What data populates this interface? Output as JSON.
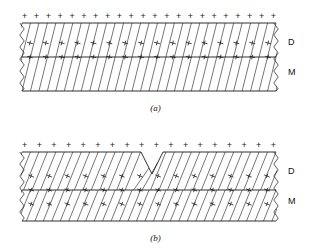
{
  "figure": {
    "type": "crystallography-schematic",
    "background_color": "#ffffff",
    "line_color": "#1a1a1a",
    "panels": [
      {
        "id": "a",
        "caption": "(a)",
        "plus_symbol": "+",
        "plus_count": 22,
        "labels": {
          "upper": "D",
          "lower": "M"
        },
        "geometry": {
          "left": 22,
          "right": 276,
          "top": 23,
          "bottom": 91,
          "interface_y": 57,
          "sub_band_y": 43,
          "upper_hatch_angle_deg": 14,
          "lower_hatch_angle_deg": 14,
          "hatch_count_upper": 30,
          "hatch_count_lower": 30,
          "dislocation_rows": [
            43,
            57
          ],
          "dislocations_per_row": 16,
          "notch": false
        }
      },
      {
        "id": "b",
        "caption": "(b)",
        "plus_symbol": "+",
        "plus_count": 18,
        "labels": {
          "upper": "D",
          "lower": "M"
        },
        "geometry": {
          "left": 22,
          "right": 276,
          "top": 152,
          "bottom": 221,
          "interface_y": 190,
          "sub_band_y": 176,
          "upper_hatch_angle_deg": 22,
          "lower_hatch_angle_deg": 22,
          "hatch_count_upper": 30,
          "hatch_count_lower": 30,
          "dislocation_rows": [
            176,
            190,
            204
          ],
          "dislocations_per_row": 14,
          "notch": true,
          "notch_center_x": 152,
          "notch_half_width": 11,
          "notch_depth": 22
        }
      }
    ]
  }
}
